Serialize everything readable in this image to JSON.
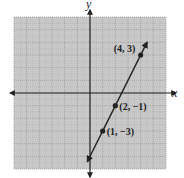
{
  "chart_data": {
    "type": "line",
    "title": "",
    "xlabel": "x",
    "ylabel": "y",
    "xlim": [
      -6,
      6
    ],
    "ylim": [
      -6,
      6
    ],
    "grid": true,
    "grid_minor": true,
    "line": {
      "equation": "y = 2x - 5",
      "slope": 2,
      "intercept": -5,
      "x_start": -0.2,
      "x_end": 4.5,
      "arrows": "both"
    },
    "points": [
      {
        "x": 4,
        "y": 3,
        "label": "(4, 3)"
      },
      {
        "x": 2,
        "y": -1,
        "label": "(2, −1)"
      },
      {
        "x": 1,
        "y": -3,
        "label": "(1, −3)"
      }
    ]
  },
  "colors": {
    "grid_background": "#c8c8c8",
    "grid_lines": "#9a9a9a",
    "axes": "#222222",
    "line": "#222222"
  }
}
